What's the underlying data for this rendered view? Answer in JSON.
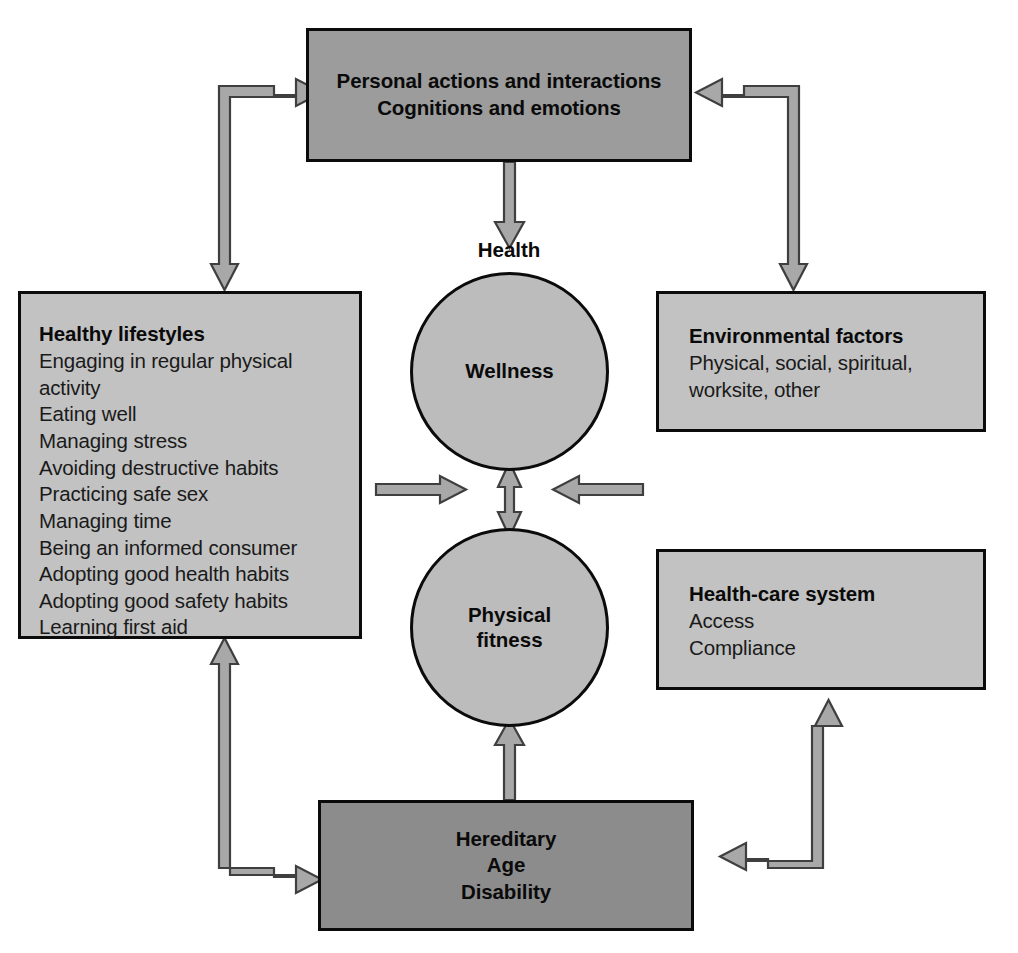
{
  "diagram": {
    "colors": {
      "box_top_fill": "#9c9c9c",
      "box_side_fill": "#c2c2c2",
      "box_bottom_fill": "#8c8c8c",
      "circle_fill": "#bcbcbc",
      "outline": "#0b0b0b",
      "arrow_fill": "#a8a8a8",
      "arrow_stroke": "#4a4a4a",
      "background": "#ffffff"
    },
    "nodes": {
      "personal_actions": {
        "lines": [
          "Personal actions and interactions",
          "Cognitions and emotions"
        ]
      },
      "healthy_lifestyles": {
        "title": "Healthy lifestyles",
        "items": [
          "Engaging in regular physical\nactivity",
          "Eating well",
          "Managing stress",
          "Avoiding destructive habits",
          "Practicing safe sex",
          "Managing time",
          "Being an informed consumer",
          "Adopting good health habits",
          "Adopting good safety habits",
          "Learning first aid"
        ]
      },
      "environmental_factors": {
        "title": "Environmental factors",
        "items": [
          "Physical, social, spiritual,\nworksite, other"
        ]
      },
      "health_care_system": {
        "title": "Health-care system",
        "items": [
          "Access",
          "Compliance"
        ]
      },
      "hereditary": {
        "lines": [
          "Hereditary",
          "Age",
          "Disability"
        ]
      },
      "wellness_circle": {
        "label": "Wellness"
      },
      "physical_fitness_circle": {
        "label": "Physical\nfitness"
      }
    },
    "labels": {
      "health": "Health"
    }
  }
}
